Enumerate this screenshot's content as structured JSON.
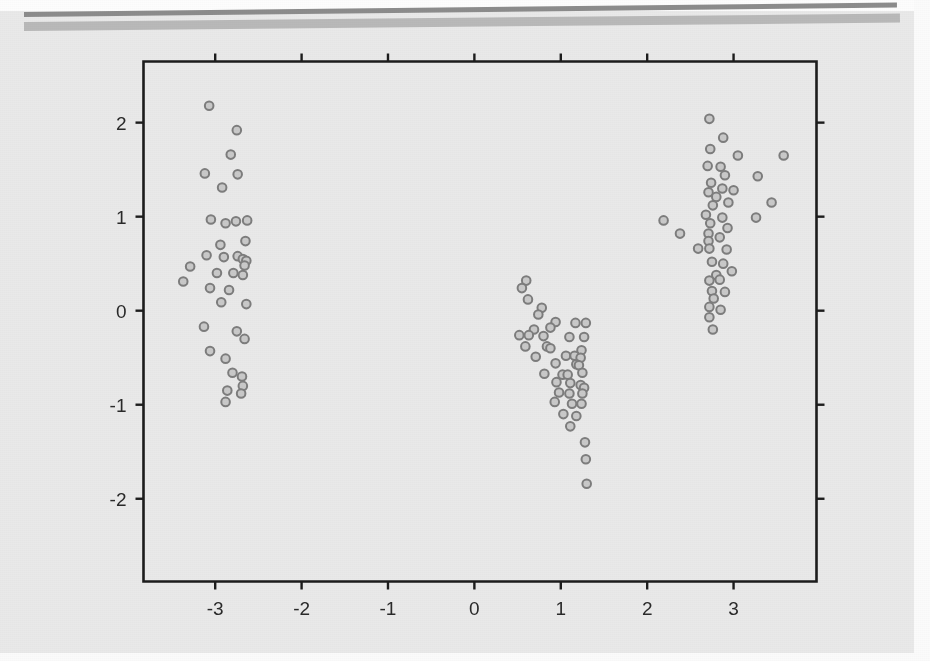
{
  "figure": {
    "background_color": "#e9e9e9",
    "frame_color": "#1c1c1c",
    "scan_bar_dark_color": "#8c8c8c",
    "scan_bar_light_color": "#b9b9b9",
    "marker_fill_color": "#c9c9c9",
    "marker_stroke_color": "#7d7d7d"
  },
  "chart_data": {
    "type": "scatter",
    "title": "",
    "subtitle": "",
    "xlabel": "",
    "ylabel": "",
    "grid": false,
    "legend": null,
    "legend_position": "none",
    "xlim": [
      -3.83,
      3.96
    ],
    "ylim": [
      -2.88,
      2.65
    ],
    "xticks": [
      -3,
      -2,
      -1,
      0,
      1,
      2,
      3
    ],
    "yticks": [
      -2,
      -1,
      0,
      1,
      2
    ],
    "xticklabels": [
      "-3",
      "-2",
      "-1",
      "0",
      "1",
      "2",
      "3"
    ],
    "yticklabels": [
      "-2",
      "-1",
      "0",
      "1",
      "2"
    ],
    "series": [
      {
        "name": "cluster-left",
        "marker": "open-circle",
        "points": [
          [
            -3.07,
            2.18
          ],
          [
            -2.75,
            1.92
          ],
          [
            -2.82,
            1.66
          ],
          [
            -3.12,
            1.46
          ],
          [
            -2.74,
            1.45
          ],
          [
            -2.92,
            1.31
          ],
          [
            -3.05,
            0.97
          ],
          [
            -2.88,
            0.93
          ],
          [
            -2.76,
            0.95
          ],
          [
            -2.63,
            0.96
          ],
          [
            -2.94,
            0.7
          ],
          [
            -2.65,
            0.74
          ],
          [
            -3.1,
            0.59
          ],
          [
            -2.9,
            0.57
          ],
          [
            -2.74,
            0.58
          ],
          [
            -2.68,
            0.55
          ],
          [
            -2.64,
            0.53
          ],
          [
            -2.66,
            0.48
          ],
          [
            -3.29,
            0.47
          ],
          [
            -2.98,
            0.4
          ],
          [
            -2.79,
            0.4
          ],
          [
            -2.68,
            0.38
          ],
          [
            -3.37,
            0.31
          ],
          [
            -3.06,
            0.24
          ],
          [
            -2.84,
            0.22
          ],
          [
            -2.93,
            0.09
          ],
          [
            -2.64,
            0.07
          ],
          [
            -3.13,
            -0.17
          ],
          [
            -2.75,
            -0.22
          ],
          [
            -2.66,
            -0.3
          ],
          [
            -3.06,
            -0.43
          ],
          [
            -2.88,
            -0.51
          ],
          [
            -2.8,
            -0.66
          ],
          [
            -2.69,
            -0.7
          ],
          [
            -2.68,
            -0.8
          ],
          [
            -2.86,
            -0.85
          ],
          [
            -2.7,
            -0.88
          ],
          [
            -2.88,
            -0.97
          ]
        ]
      },
      {
        "name": "cluster-middle",
        "marker": "open-circle",
        "points": [
          [
            0.6,
            0.32
          ],
          [
            0.55,
            0.24
          ],
          [
            0.62,
            0.12
          ],
          [
            0.78,
            0.03
          ],
          [
            0.74,
            -0.04
          ],
          [
            0.94,
            -0.12
          ],
          [
            1.17,
            -0.13
          ],
          [
            1.29,
            -0.13
          ],
          [
            0.69,
            -0.2
          ],
          [
            0.88,
            -0.18
          ],
          [
            0.52,
            -0.26
          ],
          [
            0.63,
            -0.26
          ],
          [
            0.8,
            -0.27
          ],
          [
            1.1,
            -0.28
          ],
          [
            1.27,
            -0.28
          ],
          [
            0.59,
            -0.38
          ],
          [
            0.84,
            -0.38
          ],
          [
            0.88,
            -0.4
          ],
          [
            1.24,
            -0.42
          ],
          [
            0.71,
            -0.49
          ],
          [
            1.06,
            -0.48
          ],
          [
            1.16,
            -0.48
          ],
          [
            1.23,
            -0.5
          ],
          [
            0.94,
            -0.56
          ],
          [
            1.18,
            -0.57
          ],
          [
            1.21,
            -0.58
          ],
          [
            0.81,
            -0.67
          ],
          [
            1.02,
            -0.68
          ],
          [
            1.08,
            -0.68
          ],
          [
            1.25,
            -0.66
          ],
          [
            0.95,
            -0.76
          ],
          [
            1.11,
            -0.77
          ],
          [
            1.23,
            -0.79
          ],
          [
            1.27,
            -0.82
          ],
          [
            0.98,
            -0.87
          ],
          [
            1.1,
            -0.88
          ],
          [
            1.25,
            -0.88
          ],
          [
            0.93,
            -0.97
          ],
          [
            1.13,
            -0.99
          ],
          [
            1.24,
            -0.99
          ],
          [
            1.03,
            -1.1
          ],
          [
            1.18,
            -1.12
          ],
          [
            1.11,
            -1.23
          ],
          [
            1.28,
            -1.4
          ],
          [
            1.29,
            -1.58
          ],
          [
            1.3,
            -1.84
          ]
        ]
      },
      {
        "name": "cluster-right",
        "marker": "open-circle",
        "points": [
          [
            2.72,
            2.04
          ],
          [
            2.88,
            1.84
          ],
          [
            2.73,
            1.72
          ],
          [
            3.05,
            1.65
          ],
          [
            3.58,
            1.65
          ],
          [
            2.7,
            1.54
          ],
          [
            2.85,
            1.53
          ],
          [
            2.9,
            1.44
          ],
          [
            3.28,
            1.43
          ],
          [
            2.74,
            1.36
          ],
          [
            2.87,
            1.3
          ],
          [
            3.0,
            1.28
          ],
          [
            2.71,
            1.26
          ],
          [
            2.8,
            1.21
          ],
          [
            3.44,
            1.15
          ],
          [
            2.94,
            1.15
          ],
          [
            2.76,
            1.12
          ],
          [
            2.19,
            0.96
          ],
          [
            2.68,
            1.02
          ],
          [
            2.87,
            0.99
          ],
          [
            3.26,
            0.99
          ],
          [
            2.73,
            0.93
          ],
          [
            2.93,
            0.88
          ],
          [
            2.38,
            0.82
          ],
          [
            2.71,
            0.82
          ],
          [
            2.84,
            0.78
          ],
          [
            2.71,
            0.74
          ],
          [
            2.59,
            0.66
          ],
          [
            2.72,
            0.66
          ],
          [
            2.92,
            0.65
          ],
          [
            2.75,
            0.52
          ],
          [
            2.88,
            0.5
          ],
          [
            2.98,
            0.42
          ],
          [
            2.8,
            0.38
          ],
          [
            2.84,
            0.33
          ],
          [
            2.72,
            0.32
          ],
          [
            2.75,
            0.21
          ],
          [
            2.9,
            0.2
          ],
          [
            2.77,
            0.13
          ],
          [
            2.72,
            0.04
          ],
          [
            2.85,
            0.01
          ],
          [
            2.72,
            -0.07
          ],
          [
            2.76,
            -0.2
          ]
        ]
      }
    ]
  }
}
